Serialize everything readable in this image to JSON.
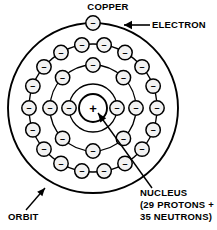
{
  "figure": {
    "title": "COPPER"
  },
  "labels": {
    "copper": "COPPER",
    "electron": "ELECTRON",
    "nucleus_line1": "NUCLEUS",
    "nucleus_line2": "(29 PROTONS +",
    "nucleus_line3": "35 NEUTRONS)",
    "orbit": "ORBIT"
  },
  "glyphs": {
    "electron_charge": "–",
    "nucleus_charge": "+"
  },
  "colors": {
    "stroke": "#000000",
    "background": "#ffffff",
    "electron_fill": "#f2f2f2",
    "text": "#000000"
  },
  "model": {
    "center_x": 93,
    "center_y": 108,
    "nucleus_radius": 14,
    "protons": 29,
    "neutrons": 35,
    "shells": [
      {
        "name": "shell-1",
        "radius": 24,
        "electrons": 2,
        "start_angle": 0
      },
      {
        "name": "shell-2",
        "radius": 43,
        "electrons": 8,
        "start_angle": 0
      },
      {
        "name": "shell-3",
        "radius": 64,
        "electrons": 18,
        "start_angle": 0
      },
      {
        "name": "shell-4",
        "radius": 85,
        "electrons": 1,
        "start_angle": -90
      }
    ],
    "electron_radius": 7.2
  },
  "annotations": {
    "copper": {
      "x": 108,
      "y": 10,
      "anchor": "middle"
    },
    "electron": {
      "x": 152,
      "y": 28,
      "anchor": "start"
    },
    "electron_arrow": {
      "x1": 150,
      "y1": 25,
      "x2": 124,
      "y2": 25
    },
    "nucleus": {
      "x": 140,
      "y": 196,
      "anchor": "start"
    },
    "nucleus_arrow": {
      "x1": 152,
      "y1": 188,
      "x2": 98,
      "y2": 113
    },
    "orbit": {
      "x": 8,
      "y": 220,
      "anchor": "start"
    },
    "orbit_arrow": {
      "x1": 26,
      "y1": 210,
      "x2": 45,
      "y2": 188
    }
  }
}
